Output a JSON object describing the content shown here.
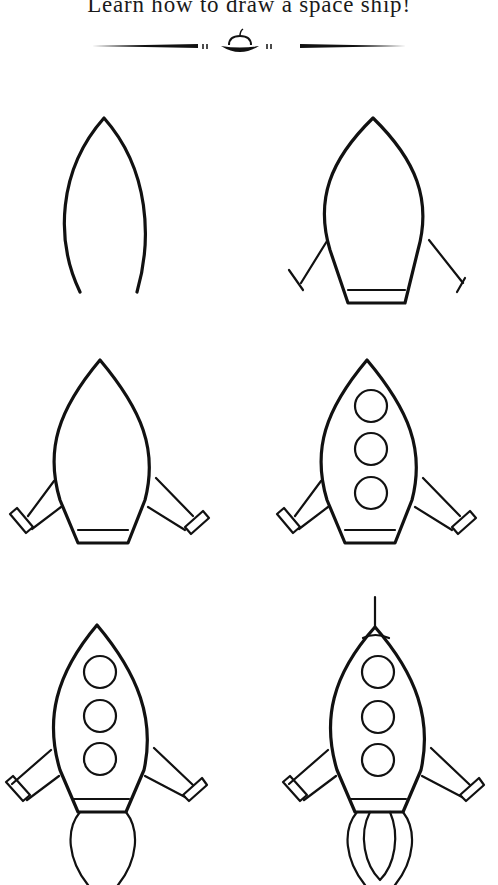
{
  "title": "Learn how to draw a space ship!",
  "divider": {
    "icon": "ufo-ornament-icon"
  },
  "steps": [
    {
      "step": 1,
      "description": "Pointed nose arch"
    },
    {
      "step": 2,
      "description": "Body outline with legs and base"
    },
    {
      "step": 3,
      "description": "Thick legs with feet"
    },
    {
      "step": 4,
      "description": "Three round windows"
    },
    {
      "step": 5,
      "description": "Exhaust flame"
    },
    {
      "step": 6,
      "description": "Antenna, nose cone and flame details"
    }
  ]
}
